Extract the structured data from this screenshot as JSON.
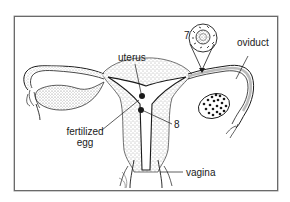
{
  "diagram": {
    "labels": {
      "uterus": "uterus",
      "oviduct": "oviduct",
      "fertilized_egg_line1": "fertilized",
      "fertilized_egg_line2": "egg",
      "vagina": "vagina",
      "marker_7": "7",
      "marker_8": "8"
    },
    "colors": {
      "line": "#1a1a1a",
      "frame": "#6a6a6a",
      "stipple": "#555555",
      "background": "#ffffff"
    }
  }
}
